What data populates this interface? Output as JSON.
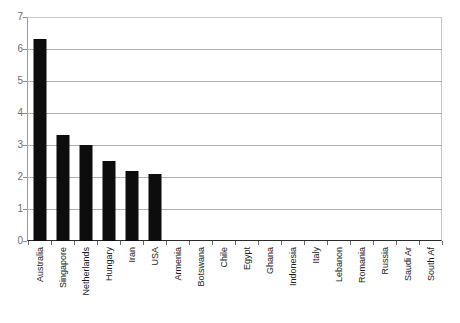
{
  "chart_data": {
    "type": "bar",
    "title": "",
    "subtitle": "",
    "xlabel": "",
    "ylabel": "",
    "ylim": [
      0,
      7
    ],
    "ytick_labels": [
      "0",
      "1",
      "2",
      "3",
      "4",
      "5",
      "6",
      "7"
    ],
    "yticks": [
      0,
      1,
      2,
      3,
      4,
      5,
      6,
      7
    ],
    "grid": "horizontal",
    "legend": "none",
    "bar_color": "#0d0d0d",
    "gridline_color": "#b0b0b0",
    "axis_color": "#2b2b2b",
    "tick_label_color": "#6e6e6e",
    "category_label_rotation": -90,
    "categories": [
      "Australia",
      "Singapore",
      "Netherlands",
      "Hungary",
      "Iran",
      "USA",
      "Armenia",
      "Botswana",
      "Chile",
      "Egypt",
      "Ghana",
      "Indonesia",
      "Italy",
      "Lebanon",
      "Romania",
      "Russia",
      "Saudi Ar",
      "South Af"
    ],
    "values": [
      6.3,
      3.3,
      3.0,
      2.5,
      2.2,
      2.1,
      0,
      0,
      0,
      0,
      0,
      0,
      0,
      0,
      0,
      0,
      0,
      0
    ]
  }
}
